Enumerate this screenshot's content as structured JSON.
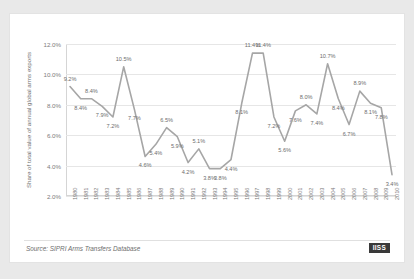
{
  "chart_data": {
    "type": "line",
    "title": "",
    "subtitle": "",
    "xlabel": "",
    "ylabel": "Share of total value of annual global arms exports",
    "ylim": [
      2.0,
      12.0
    ],
    "ytick_labels": [
      "2.0%",
      "4.0%",
      "6.0%",
      "8.0%",
      "10.0%",
      "12.0%"
    ],
    "ytick_values": [
      2.0,
      4.0,
      6.0,
      8.0,
      10.0,
      12.0
    ],
    "grid": true,
    "legend": "none",
    "line_color": "#a6a6a6",
    "categories": [
      "1980",
      "1981",
      "1982",
      "1983",
      "1984",
      "1985",
      "1986",
      "1987",
      "1988",
      "1989",
      "1990",
      "1991",
      "1992",
      "1993",
      "1994",
      "1995",
      "1996",
      "1997",
      "1998",
      "1999",
      "2000",
      "2001",
      "2002",
      "2003",
      "2004",
      "2005",
      "2006",
      "2007",
      "2008",
      "2009",
      "2010"
    ],
    "values": [
      9.2,
      8.4,
      8.4,
      7.9,
      7.2,
      10.5,
      7.7,
      4.6,
      5.4,
      6.5,
      5.9,
      4.2,
      5.1,
      3.8,
      3.8,
      4.4,
      8.1,
      11.4,
      11.4,
      7.2,
      5.6,
      7.6,
      8.0,
      7.4,
      10.7,
      8.4,
      6.7,
      8.9,
      8.1,
      7.8,
      3.4
    ],
    "data_labels": [
      "9.2%",
      "8.4%",
      "8.4%",
      "7.9%",
      "7.2%",
      "10.5%",
      "7.7%",
      "4.6%",
      "5.4%",
      "6.5%",
      "5.9%",
      "4.2%",
      "5.1%",
      "3.8%",
      "3.8%",
      "4.4%",
      "8.1%",
      "11.4%",
      "11.4%",
      "7.2%",
      "5.6%",
      "7.6%",
      "8.0%",
      "7.4%",
      "10.7%",
      "8.4%",
      "6.7%",
      "8.9%",
      "8.1%",
      "7.8%",
      "3.4%"
    ]
  },
  "footer": {
    "source": "Source: SIPRI Arms Transfers Database",
    "logo": "IISS"
  }
}
